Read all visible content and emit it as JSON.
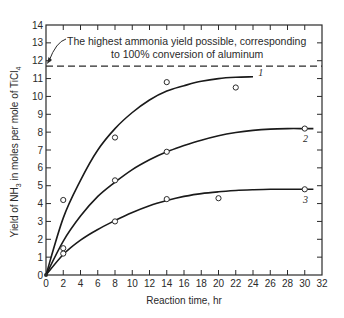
{
  "chart_data": {
    "type": "line",
    "title": "",
    "xlabel": "Reaction time, hr",
    "ylabel": "Yield of NH3 in moles per mole of TiCl4",
    "ylabel_parts": {
      "pre": "Yield of NH",
      "sub1": "3",
      "mid": " in moles per mole of TiCl",
      "sub2": "4"
    },
    "xlim": [
      0,
      32
    ],
    "ylim": [
      0,
      14
    ],
    "xticks": [
      0,
      2,
      4,
      6,
      8,
      10,
      12,
      14,
      16,
      18,
      20,
      22,
      24,
      26,
      28,
      30,
      32
    ],
    "yticks": [
      0,
      1,
      2,
      3,
      4,
      5,
      6,
      7,
      8,
      9,
      10,
      11,
      12,
      13,
      14
    ],
    "grid": false,
    "reference_line": {
      "y": 11.7,
      "style": "dashed",
      "annotation_line1": "The highest ammonia yield possible, corresponding",
      "annotation_line2": "to 100% conversion of aluminum"
    },
    "series": [
      {
        "name": "1",
        "points": [
          [
            0,
            0
          ],
          [
            2,
            4.2
          ],
          [
            8,
            7.7
          ],
          [
            14,
            10.8
          ],
          [
            22,
            10.5
          ]
        ],
        "curve": [
          [
            0,
            0
          ],
          [
            2,
            3.2
          ],
          [
            4,
            5.3
          ],
          [
            6,
            7.0
          ],
          [
            8,
            8.2
          ],
          [
            10,
            9.1
          ],
          [
            12,
            9.8
          ],
          [
            14,
            10.3
          ],
          [
            16,
            10.6
          ],
          [
            18,
            10.85
          ],
          [
            20,
            11.0
          ],
          [
            22,
            11.07
          ],
          [
            24,
            11.1
          ]
        ],
        "label_at": [
          24.6,
          11.3
        ]
      },
      {
        "name": "2",
        "points": [
          [
            0,
            0
          ],
          [
            2,
            1.5
          ],
          [
            8,
            5.3
          ],
          [
            14,
            6.9
          ],
          [
            30,
            8.2
          ]
        ],
        "curve": [
          [
            0,
            0
          ],
          [
            2,
            1.9
          ],
          [
            4,
            3.3
          ],
          [
            6,
            4.4
          ],
          [
            8,
            5.2
          ],
          [
            10,
            5.9
          ],
          [
            12,
            6.45
          ],
          [
            14,
            6.9
          ],
          [
            16,
            7.25
          ],
          [
            18,
            7.55
          ],
          [
            20,
            7.8
          ],
          [
            22,
            7.98
          ],
          [
            24,
            8.1
          ],
          [
            26,
            8.17
          ],
          [
            28,
            8.2
          ],
          [
            30,
            8.2
          ],
          [
            31,
            8.2
          ]
        ],
        "label_at": [
          29.8,
          7.6
        ]
      },
      {
        "name": "3",
        "points": [
          [
            0,
            0
          ],
          [
            2,
            1.2
          ],
          [
            8,
            3.0
          ],
          [
            14,
            4.25
          ],
          [
            20,
            4.3
          ],
          [
            30,
            4.8
          ]
        ],
        "curve": [
          [
            0,
            0
          ],
          [
            2,
            1.15
          ],
          [
            4,
            1.95
          ],
          [
            6,
            2.55
          ],
          [
            8,
            3.05
          ],
          [
            10,
            3.5
          ],
          [
            12,
            3.88
          ],
          [
            14,
            4.17
          ],
          [
            16,
            4.4
          ],
          [
            18,
            4.56
          ],
          [
            20,
            4.66
          ],
          [
            22,
            4.73
          ],
          [
            24,
            4.77
          ],
          [
            26,
            4.8
          ],
          [
            28,
            4.8
          ],
          [
            30,
            4.8
          ],
          [
            31,
            4.8
          ]
        ],
        "label_at": [
          29.8,
          4.2
        ]
      }
    ]
  }
}
